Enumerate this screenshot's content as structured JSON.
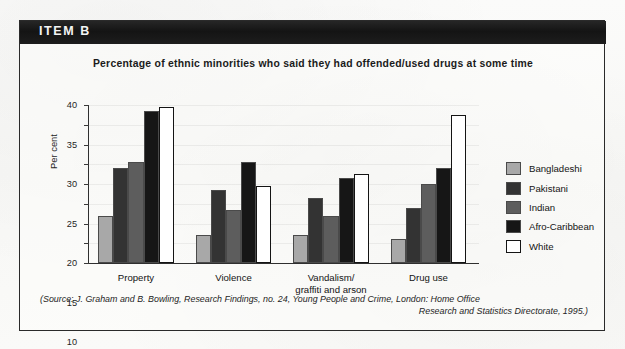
{
  "item": {
    "label": "ITEM B"
  },
  "source": {
    "line1": "(Source: J. Graham and B. Bowling, Research Findings, no. 24, Young People and Crime, London: Home Office",
    "line2": "Research and Statistics Directorate, 1995.)"
  },
  "chart_data": {
    "type": "bar",
    "title": "Percentage of ethnic minorities who said they had offended/used drugs at some time",
    "xlabel": "",
    "ylabel": "Per cent",
    "ylim": [
      0,
      40
    ],
    "yticks": [
      0,
      5,
      10,
      15,
      20,
      25,
      30,
      35,
      40
    ],
    "grid": false,
    "legend_position": "right",
    "categories": [
      "Property",
      "Violence",
      "Vandalism/\ngraffiti and arson",
      "Drug use"
    ],
    "series": [
      {
        "name": "Bangladeshi",
        "color": "#a8a8a8",
        "values": [
          12,
          7,
          7,
          6
        ]
      },
      {
        "name": "Pakistani",
        "color": "#333333",
        "values": [
          24,
          18.5,
          16.5,
          14
        ]
      },
      {
        "name": "Indian",
        "color": "#5d5d5d",
        "values": [
          25.5,
          13.5,
          12,
          20
        ]
      },
      {
        "name": "Afro-Caribbean",
        "color": "#161616",
        "values": [
          38.5,
          25.5,
          21.5,
          24
        ]
      },
      {
        "name": "White",
        "color": "#ffffff",
        "values": [
          39.5,
          19.5,
          22.5,
          37.5
        ]
      }
    ]
  }
}
